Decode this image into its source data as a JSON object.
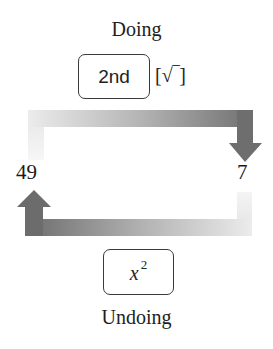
{
  "diagram": {
    "top_label": "Doing",
    "bottom_label": "Undoing",
    "doing_key": {
      "label": "2nd",
      "secondary": "[√‾]"
    },
    "undoing_key": {
      "base": "x",
      "exponent": "2"
    },
    "left_value": "49",
    "right_value": "7",
    "arrows": {
      "top": {
        "direction": "left-to-right-then-down",
        "from": "49",
        "to": "7"
      },
      "bottom": {
        "direction": "right-to-left-then-up",
        "from": "7",
        "to": "49"
      }
    },
    "colors": {
      "arrow_dark": "#6e6e6e",
      "arrow_light": "#e6e6e6",
      "text": "#1e1e1e"
    }
  }
}
